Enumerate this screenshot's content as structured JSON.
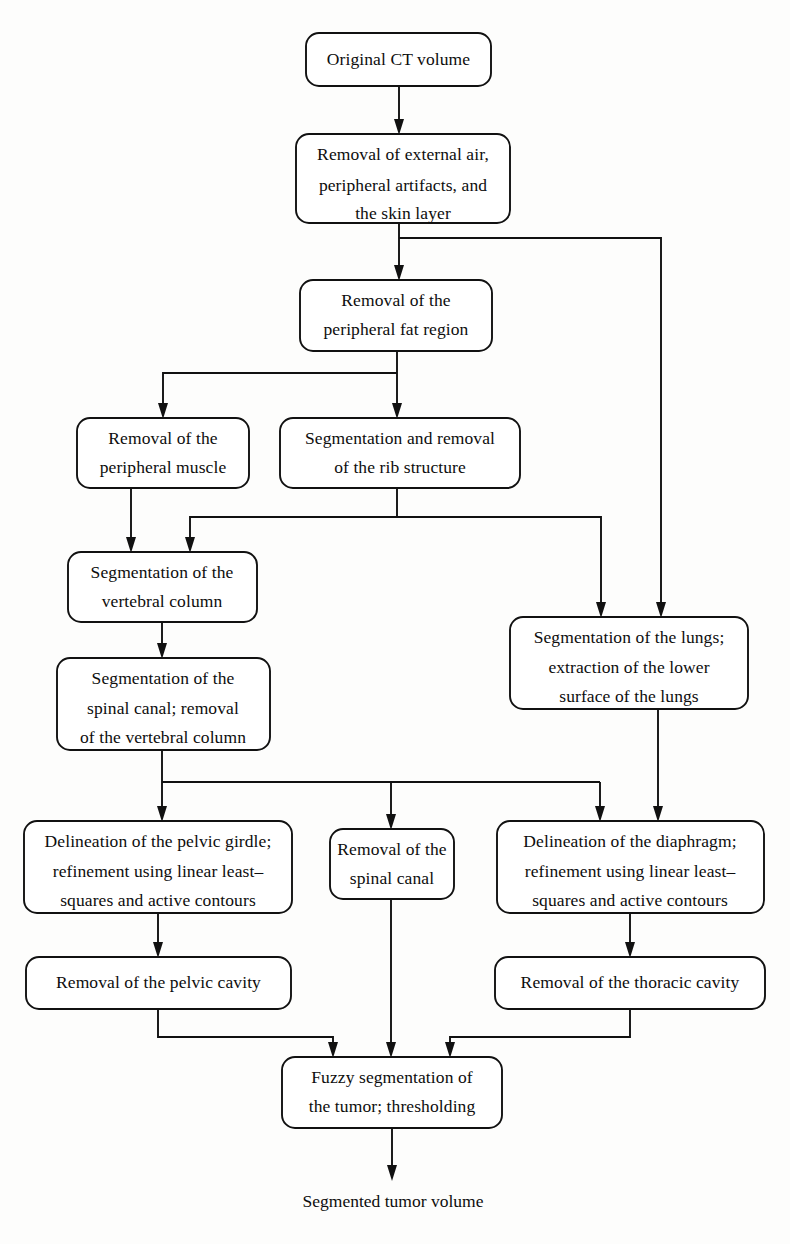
{
  "diagram": {
    "title_text": "",
    "type": "flowchart",
    "orientation": "top-to-bottom",
    "style": {
      "background_color": "#fdfdfc",
      "box_fill": "#ffffff",
      "stroke_color": "#111111",
      "text_color": "#0d0d0d"
    },
    "nodes": [
      {
        "id": "n1",
        "shape": "rounded-rect",
        "lines": [
          "Original CT volume"
        ],
        "x": 306,
        "y": 33,
        "w": 185,
        "h": 53
      },
      {
        "id": "n2",
        "shape": "rounded-rect",
        "lines": [
          "Removal of external air,",
          "peripheral artifacts, and",
          "the skin layer"
        ],
        "x": 296,
        "y": 134,
        "w": 214,
        "h": 89
      },
      {
        "id": "n3",
        "shape": "rounded-rect",
        "lines": [
          "Removal of the",
          "peripheral fat region"
        ],
        "x": 300,
        "y": 280,
        "w": 192,
        "h": 71
      },
      {
        "id": "n4",
        "shape": "rounded-rect",
        "lines": [
          "Removal of the",
          "peripheral muscle"
        ],
        "x": 77,
        "y": 418,
        "w": 172,
        "h": 70
      },
      {
        "id": "n5",
        "shape": "rounded-rect",
        "lines": [
          "Segmentation and removal",
          "of the rib structure"
        ],
        "x": 280,
        "y": 418,
        "w": 240,
        "h": 70
      },
      {
        "id": "n6",
        "shape": "rounded-rect",
        "lines": [
          "Segmentation of  the",
          "vertebral column"
        ],
        "x": 68,
        "y": 552,
        "w": 189,
        "h": 70
      },
      {
        "id": "n7",
        "shape": "rounded-rect",
        "lines": [
          "Segmentation of the",
          "spinal canal; removal",
          "of the vertebral column"
        ],
        "x": 57,
        "y": 658,
        "w": 213,
        "h": 92
      },
      {
        "id": "n8",
        "shape": "rounded-rect",
        "lines": [
          "Segmentation of the lungs;",
          "extraction of the lower",
          "surface of the lungs"
        ],
        "x": 510,
        "y": 617,
        "w": 238,
        "h": 92
      },
      {
        "id": "n9",
        "shape": "rounded-rect",
        "lines": [
          "Delineation of the pelvic girdle;",
          "refinement using linear least–",
          "squares and active contours"
        ],
        "x": 24,
        "y": 821,
        "w": 268,
        "h": 92
      },
      {
        "id": "n10",
        "shape": "rounded-rect",
        "lines": [
          "Removal of the",
          "spinal canal"
        ],
        "x": 330,
        "y": 829,
        "w": 124,
        "h": 70
      },
      {
        "id": "n11",
        "shape": "rounded-rect",
        "lines": [
          "Delineation of the diaphragm;",
          "refinement using linear least–",
          "squares and active contours"
        ],
        "x": 497,
        "y": 821,
        "w": 267,
        "h": 92
      },
      {
        "id": "n12",
        "shape": "rounded-rect",
        "lines": [
          "Removal of the pelvic cavity"
        ],
        "x": 26,
        "y": 957,
        "w": 265,
        "h": 52
      },
      {
        "id": "n13",
        "shape": "rounded-rect",
        "lines": [
          "Removal of the thoracic cavity"
        ],
        "x": 495,
        "y": 957,
        "w": 270,
        "h": 52
      },
      {
        "id": "n14",
        "shape": "rounded-rect",
        "lines": [
          "Fuzzy segmentation of",
          "the tumor; thresholding"
        ],
        "x": 282,
        "y": 1057,
        "w": 220,
        "h": 71
      },
      {
        "id": "n15",
        "shape": "plain-text",
        "lines": [
          "Segmented tumor volume"
        ],
        "x": 283,
        "y": 1201,
        "w": 222,
        "h": 26
      }
    ],
    "edges": [
      {
        "from": "n1",
        "to": "n2",
        "label": ""
      },
      {
        "from": "n2",
        "to": "n3",
        "label": ""
      },
      {
        "from": "n2",
        "to": "n8",
        "label": ""
      },
      {
        "from": "n3",
        "to": "n4",
        "label": ""
      },
      {
        "from": "n3",
        "to": "n5",
        "label": ""
      },
      {
        "from": "n4",
        "to": "n6",
        "label": ""
      },
      {
        "from": "n5",
        "to": "n6",
        "label": ""
      },
      {
        "from": "n5",
        "to": "n8",
        "label": ""
      },
      {
        "from": "n6",
        "to": "n7",
        "label": ""
      },
      {
        "from": "n7",
        "to": "n9",
        "label": ""
      },
      {
        "from": "n7",
        "to": "n10",
        "label": ""
      },
      {
        "from": "n7",
        "to": "n11",
        "label": ""
      },
      {
        "from": "n8",
        "to": "n11",
        "label": ""
      },
      {
        "from": "n9",
        "to": "n12",
        "label": ""
      },
      {
        "from": "n10",
        "to": "n14",
        "label": ""
      },
      {
        "from": "n11",
        "to": "n13",
        "label": ""
      },
      {
        "from": "n12",
        "to": "n14",
        "label": ""
      },
      {
        "from": "n13",
        "to": "n14",
        "label": ""
      },
      {
        "from": "n14",
        "to": "n15",
        "label": ""
      }
    ]
  }
}
